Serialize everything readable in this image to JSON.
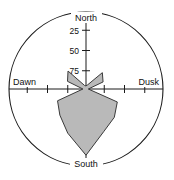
{
  "chart_data": {
    "type": "area",
    "subtype": "rose-diagram",
    "title": "",
    "xlabel": "",
    "ylabel": "",
    "grid": false,
    "legend": null,
    "center": {
      "x": 86,
      "y": 89
    },
    "outer_radius": 77,
    "radial_axis": {
      "ticks": [
        25,
        50,
        75
      ],
      "tick_labels": [
        "25",
        "50",
        "75"
      ],
      "max": 100,
      "minor_tick_step": 25
    },
    "cardinal_labels": {
      "north": "North",
      "south": "South",
      "east": "Dusk",
      "west": "Dawn"
    },
    "colors": {
      "fill": "#b9b9b9",
      "stroke": "#3a3a3a",
      "axis": "#1a1a1a",
      "background": "#ffffff"
    },
    "categories": [
      "N",
      "NNE",
      "NE",
      "ENE",
      "E",
      "ESE",
      "SE",
      "SSE",
      "S",
      "SSW",
      "SW",
      "WSW",
      "W",
      "WNW",
      "NW",
      "NNW"
    ],
    "angles_deg": [
      0,
      22.5,
      45,
      67.5,
      90,
      112.5,
      135,
      157.5,
      180,
      202.5,
      225,
      247.5,
      270,
      292.5,
      315,
      337.5
    ],
    "values": [
      4,
      6,
      30,
      24,
      3,
      44,
      52,
      60,
      86,
      62,
      48,
      40,
      4,
      26,
      33,
      5
    ]
  }
}
